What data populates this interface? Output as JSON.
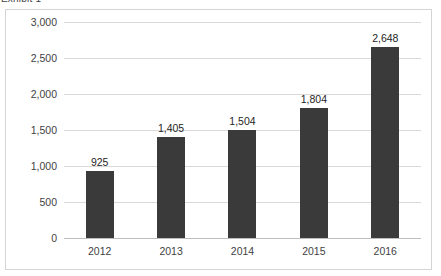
{
  "caption": {
    "text": "Exhibit 1"
  },
  "chart_data": {
    "type": "bar",
    "title": "",
    "xlabel": "",
    "ylabel": "",
    "categories": [
      "2012",
      "2013",
      "2014",
      "2015",
      "2016"
    ],
    "values": [
      925,
      1405,
      1504,
      1804,
      2648
    ],
    "value_labels": [
      "925",
      "1,405",
      "1,504",
      "1,804",
      "2,648"
    ],
    "ylim": [
      0,
      3000
    ],
    "yticks": [
      0,
      500,
      1000,
      1500,
      2000,
      2500,
      3000
    ],
    "ytick_labels": [
      "0",
      "500",
      "1,000",
      "1,500",
      "2,000",
      "2,500",
      "3,000"
    ],
    "grid": true,
    "legend": false,
    "bar_color": "#3a3a3a",
    "gridline_color": "#d9d9d9",
    "frame_color": "#d4d4d4"
  }
}
